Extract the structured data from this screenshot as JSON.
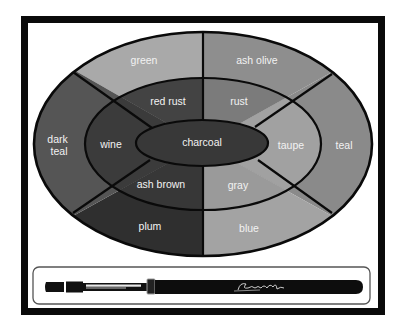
{
  "palette": {
    "outer_ring": [
      {
        "id": "green",
        "label": "green",
        "color": "#a9a9a9",
        "label_pos": [
          144,
          64
        ]
      },
      {
        "id": "ash-olive",
        "label": "ash olive",
        "color": "#8e8e8e",
        "label_pos": [
          257,
          64
        ]
      },
      {
        "id": "teal",
        "label": "teal",
        "color": "#8a8a8a",
        "label_pos": [
          344,
          149
        ]
      },
      {
        "id": "blue",
        "label": "blue",
        "color": "#a3a3a3",
        "label_pos": [
          249,
          232
        ]
      },
      {
        "id": "plum",
        "label": "plum",
        "color": "#2f2f2f",
        "label_pos": [
          150,
          230
        ]
      },
      {
        "id": "dark-teal",
        "label": "dark teal",
        "color": "#555555",
        "label_lines": [
          "dark",
          "teal"
        ],
        "label_pos": [
          59,
          143
        ]
      }
    ],
    "middle_ring": [
      {
        "id": "red-rust",
        "label": "red rust",
        "color": "#434343",
        "label_pos": [
          168,
          105
        ]
      },
      {
        "id": "rust",
        "label": "rust",
        "color": "#7b7b7b",
        "label_pos": [
          239,
          105
        ]
      },
      {
        "id": "taupe",
        "label": "taupe",
        "color": "#a1a1a1",
        "label_pos": [
          291,
          149
        ]
      },
      {
        "id": "gray",
        "label": "gray",
        "color": "#9a9a9a",
        "label_pos": [
          238,
          189
        ]
      },
      {
        "id": "ash-brown",
        "label": "ash brown",
        "color": "#373737",
        "label_pos": [
          161,
          188
        ]
      },
      {
        "id": "wine",
        "label": "wine",
        "color": "#3b3b3b",
        "label_pos": [
          111,
          148
        ]
      }
    ],
    "center": {
      "id": "charcoal",
      "label": "charcoal",
      "color": "#383838",
      "label_pos": [
        202,
        146
      ]
    }
  },
  "brush": {
    "signature": "signature-script"
  }
}
